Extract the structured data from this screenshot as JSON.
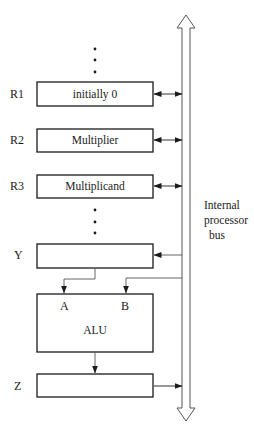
{
  "diagram": {
    "title": "",
    "bus": {
      "label_lines": [
        "Internal",
        "processor",
        "bus"
      ]
    },
    "registers": [
      {
        "name": "R1",
        "content": "initially  0"
      },
      {
        "name": "R2",
        "content": "Multiplier"
      },
      {
        "name": "R3",
        "content": "Multiplicand"
      },
      {
        "name": "Y",
        "content": ""
      },
      {
        "name": "Z",
        "content": ""
      }
    ],
    "alu": {
      "label": "ALU",
      "input_a": "A",
      "input_b": "B"
    },
    "ellipsis": [
      "•",
      "•",
      "•"
    ],
    "colors": {
      "line": "#1a1a1a",
      "bus": "#555555",
      "background": "#ffffff"
    }
  }
}
